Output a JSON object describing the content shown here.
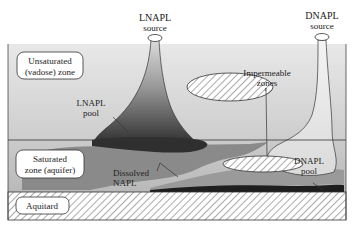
{
  "diagram": {
    "type": "groundwater contamination cross-section",
    "sources": {
      "lnapl": {
        "line1": "LNAPL",
        "line2": "source"
      },
      "dnapl": {
        "line1": "DNAPL",
        "line2": "source"
      }
    },
    "zones": {
      "unsaturated": {
        "line1": "Unsaturated",
        "line2": "(vadose) zone"
      },
      "saturated": {
        "line1": "Saturated",
        "line2": "zone (aquifer)"
      },
      "aquitard": {
        "label": "Aquitard"
      }
    },
    "labels": {
      "lnapl_pool": {
        "line1": "LNAPL",
        "line2": "pool"
      },
      "impermeable": {
        "line1": "Impermeable",
        "line2": "zones"
      },
      "dissolved": {
        "line1": "Dissolved",
        "line2": "NAPL"
      },
      "dnapl_pool": {
        "line1": "DNAPL",
        "line2": "pool"
      }
    },
    "colors": {
      "vadose_top": "#e6e6e6",
      "vadose_bottom": "#cfcfcf",
      "aquifer": "#c4c4c4",
      "plume_dark": "#3a3a3a",
      "dissolved": "#7a7a7a",
      "outline": "#333333"
    }
  }
}
